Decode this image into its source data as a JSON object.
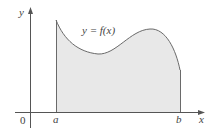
{
  "figure": {
    "curve_label": "y = f(x)",
    "axes": {
      "x_label": "x",
      "y_label": "y",
      "origin_label": "0"
    },
    "bounds": {
      "lower_label": "a",
      "upper_label": "b"
    },
    "colors": {
      "axis": "#555555",
      "curve": "#6a6a6a",
      "fill": "#e8e8e8",
      "text": "#444444"
    }
  }
}
